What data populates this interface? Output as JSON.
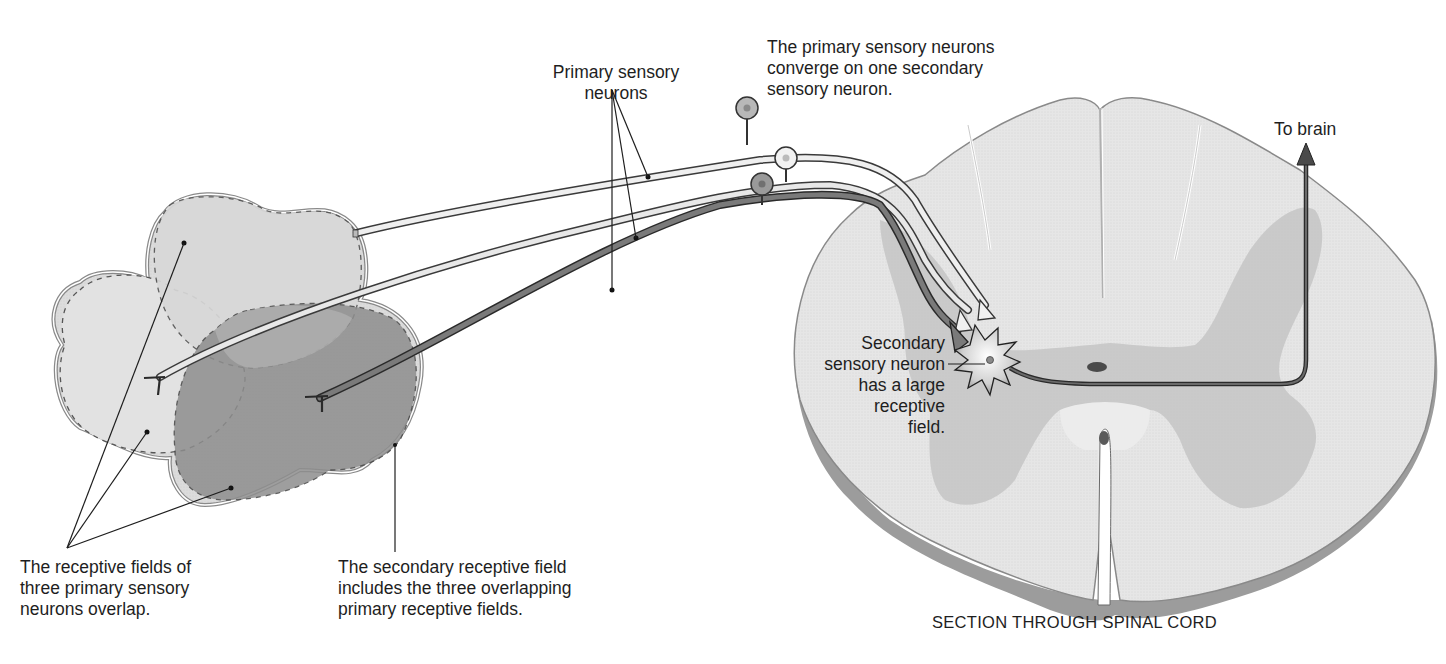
{
  "figure": {
    "caption": "SECTION THROUGH SPINAL CORD"
  },
  "labels": {
    "primary_sensory_neurons": [
      "Primary sensory",
      "neurons"
    ],
    "convergence": [
      "The primary sensory neurons",
      "converge on one secondary",
      "sensory neuron."
    ],
    "to_brain": "To brain",
    "secondary_neuron": [
      "Secondary",
      "sensory neuron",
      "has a large",
      "receptive",
      "field."
    ],
    "primary_fields_overlap": [
      "The receptive fields of",
      "three primary sensory",
      "neurons overlap."
    ],
    "secondary_field": [
      "The secondary receptive field",
      "includes the three overlapping",
      "primary receptive fields."
    ]
  },
  "colors": {
    "background": "#ffffff",
    "text": "#1e1e1e",
    "field_light": "#dcdcdc",
    "field_mid": "#c4c4c4",
    "field_dark": "#8e8e8e",
    "field_outline": "#8a8a8a",
    "white_matter": "#e6e6e6",
    "gray_matter": "#c6c6c6",
    "cord_edge": "#9c9c9c",
    "neuron_light": "#efefef",
    "neuron_mid": "#c8c8c8",
    "neuron_dark": "#7a7a7a",
    "line": "#2a2a2a"
  }
}
